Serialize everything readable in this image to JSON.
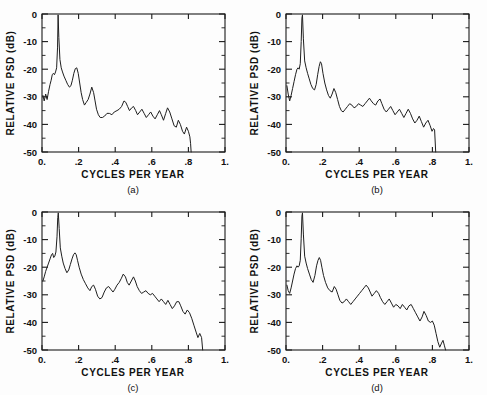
{
  "figure": {
    "panels": [
      {
        "id": "a",
        "label": "(a)",
        "xlabel": "CYCLES  PER  YEAR",
        "ylabel": "RELATIVE  PSD   (dB)",
        "xticklabels": [
          "0.",
          ".2",
          ".4",
          ".6",
          ".8",
          "1."
        ],
        "yticklabels": [
          "0",
          "-10",
          "-20",
          "-30",
          "-40",
          "-50"
        ]
      },
      {
        "id": "b",
        "label": "(b)",
        "xlabel": "CYCLES  PER  YEAR",
        "ylabel": "RELATIVE  PSD   (dB)",
        "xticklabels": [
          "0.",
          ".2",
          ".4",
          ".6",
          ".8",
          "1."
        ],
        "yticklabels": [
          "0",
          "-10",
          "-20",
          "-30",
          "-40",
          "-50"
        ]
      },
      {
        "id": "c",
        "label": "(c)",
        "xlabel": "CYCLES  PER  YEAR",
        "ylabel": "RELATIVE  PSD   (dB)",
        "xticklabels": [
          "0.",
          ".2",
          ".4",
          ".6",
          ".8",
          "1."
        ],
        "yticklabels": [
          "0",
          "-10",
          "-20",
          "-30",
          "-40",
          "-50"
        ]
      },
      {
        "id": "d",
        "label": "(d)",
        "xlabel": "CYCLES  PER  YEAR",
        "ylabel": "RELATIVE  PSD   (dB)",
        "xticklabels": [
          "0.",
          ".2",
          ".4",
          ".6",
          ".8",
          "1."
        ],
        "yticklabels": [
          "0",
          "-10",
          "-20",
          "-30",
          "-40",
          "-50"
        ]
      }
    ]
  },
  "chart_data": [
    {
      "type": "line",
      "title": "(a)",
      "xlabel": "CYCLES PER YEAR",
      "ylabel": "RELATIVE PSD (dB)",
      "xlim": [
        0.0,
        1.0
      ],
      "ylim": [
        -50,
        0
      ],
      "xticks": [
        0.0,
        0.2,
        0.4,
        0.6,
        0.8,
        1.0
      ],
      "yticks": [
        0,
        -10,
        -20,
        -30,
        -40,
        -50
      ],
      "grid": false,
      "legend": null,
      "x": [
        0.005,
        0.012,
        0.02,
        0.028,
        0.036,
        0.044,
        0.05,
        0.056,
        0.062,
        0.068,
        0.074,
        0.08,
        0.085,
        0.088,
        0.092,
        0.098,
        0.105,
        0.112,
        0.12,
        0.13,
        0.14,
        0.15,
        0.158,
        0.166,
        0.174,
        0.182,
        0.19,
        0.198,
        0.206,
        0.214,
        0.222,
        0.232,
        0.242,
        0.252,
        0.262,
        0.272,
        0.282,
        0.29,
        0.298,
        0.308,
        0.318,
        0.33,
        0.342,
        0.355,
        0.368,
        0.382,
        0.395,
        0.41,
        0.422,
        0.435,
        0.448,
        0.458,
        0.468,
        0.478,
        0.49,
        0.5,
        0.512,
        0.522,
        0.534,
        0.546,
        0.558,
        0.57,
        0.582,
        0.594,
        0.606,
        0.618,
        0.63,
        0.642,
        0.652,
        0.664,
        0.676,
        0.686,
        0.698,
        0.71,
        0.722,
        0.734,
        0.745,
        0.756,
        0.768,
        0.778,
        0.79,
        0.8,
        0.808,
        0.812,
        0.815
      ],
      "y": [
        -29.5,
        -31.5,
        -29.0,
        -31.0,
        -28.0,
        -25.5,
        -24.0,
        -22.0,
        -21.5,
        -22.0,
        -21.0,
        -19.5,
        -12.0,
        -0.3,
        -8.5,
        -16.5,
        -19.5,
        -21.0,
        -22.5,
        -24.0,
        -25.5,
        -26.5,
        -26.0,
        -24.0,
        -21.5,
        -19.8,
        -19.5,
        -21.5,
        -25.0,
        -28.5,
        -31.0,
        -33.0,
        -32.0,
        -31.0,
        -29.0,
        -26.5,
        -28.5,
        -31.5,
        -34.5,
        -36.5,
        -37.5,
        -37.5,
        -37.0,
        -36.0,
        -36.0,
        -36.5,
        -35.5,
        -35.0,
        -34.5,
        -33.5,
        -31.5,
        -32.0,
        -33.5,
        -35.0,
        -34.0,
        -33.5,
        -35.0,
        -36.5,
        -35.5,
        -34.5,
        -36.0,
        -37.5,
        -36.5,
        -35.5,
        -37.0,
        -38.0,
        -36.5,
        -35.0,
        -36.5,
        -38.5,
        -36.0,
        -34.0,
        -35.5,
        -38.0,
        -40.5,
        -41.0,
        -38.5,
        -40.0,
        -42.5,
        -43.5,
        -41.0,
        -42.5,
        -44.5,
        -47.0,
        -50.0
      ]
    },
    {
      "type": "line",
      "title": "(b)",
      "xlabel": "CYCLES PER YEAR",
      "ylabel": "RELATIVE PSD (dB)",
      "xlim": [
        0.0,
        1.0
      ],
      "ylim": [
        -50,
        0
      ],
      "xticks": [
        0.0,
        0.2,
        0.4,
        0.6,
        0.8,
        1.0
      ],
      "yticks": [
        0,
        -10,
        -20,
        -30,
        -40,
        -50
      ],
      "grid": false,
      "legend": null,
      "x": [
        0.005,
        0.012,
        0.02,
        0.028,
        0.036,
        0.044,
        0.052,
        0.06,
        0.066,
        0.072,
        0.078,
        0.083,
        0.087,
        0.09,
        0.095,
        0.102,
        0.11,
        0.118,
        0.127,
        0.136,
        0.146,
        0.156,
        0.165,
        0.173,
        0.181,
        0.188,
        0.194,
        0.202,
        0.212,
        0.222,
        0.232,
        0.242,
        0.252,
        0.262,
        0.272,
        0.282,
        0.292,
        0.302,
        0.312,
        0.324,
        0.336,
        0.348,
        0.36,
        0.372,
        0.384,
        0.396,
        0.408,
        0.42,
        0.432,
        0.444,
        0.456,
        0.466,
        0.478,
        0.49,
        0.502,
        0.514,
        0.524,
        0.536,
        0.548,
        0.56,
        0.572,
        0.584,
        0.596,
        0.608,
        0.62,
        0.632,
        0.644,
        0.656,
        0.668,
        0.68,
        0.692,
        0.704,
        0.716,
        0.728,
        0.74,
        0.752,
        0.764,
        0.776,
        0.788,
        0.798,
        0.806,
        0.812,
        0.818
      ],
      "y": [
        -26.0,
        -29.0,
        -31.5,
        -29.5,
        -27.0,
        -24.5,
        -22.0,
        -20.0,
        -19.5,
        -20.0,
        -18.0,
        -10.0,
        -1.5,
        -0.3,
        -9.0,
        -17.0,
        -19.5,
        -21.5,
        -23.5,
        -25.5,
        -27.0,
        -27.5,
        -25.5,
        -22.0,
        -19.0,
        -17.3,
        -18.0,
        -21.5,
        -25.0,
        -27.5,
        -29.5,
        -30.5,
        -29.0,
        -27.0,
        -28.5,
        -31.0,
        -33.5,
        -35.0,
        -35.5,
        -34.5,
        -33.5,
        -32.5,
        -33.0,
        -34.0,
        -33.5,
        -32.5,
        -33.0,
        -33.5,
        -32.5,
        -31.5,
        -30.5,
        -31.5,
        -32.5,
        -33.0,
        -31.5,
        -30.8,
        -32.5,
        -34.5,
        -35.5,
        -34.5,
        -33.5,
        -35.0,
        -36.5,
        -35.5,
        -34.5,
        -36.0,
        -37.5,
        -36.0,
        -34.5,
        -36.0,
        -38.0,
        -39.5,
        -38.5,
        -37.0,
        -39.0,
        -41.0,
        -39.5,
        -38.5,
        -40.5,
        -42.5,
        -41.5,
        -42.0,
        -50.0
      ]
    },
    {
      "type": "line",
      "title": "(c)",
      "xlabel": "CYCLES PER YEAR",
      "ylabel": "RELATIVE PSD (dB)",
      "xlim": [
        0.0,
        1.0
      ],
      "ylim": [
        -50,
        0
      ],
      "xticks": [
        0.0,
        0.2,
        0.4,
        0.6,
        0.8,
        1.0
      ],
      "yticks": [
        0,
        -10,
        -20,
        -30,
        -40,
        -50
      ],
      "grid": false,
      "legend": null,
      "x": [
        0.005,
        0.012,
        0.02,
        0.028,
        0.036,
        0.044,
        0.052,
        0.058,
        0.064,
        0.07,
        0.076,
        0.082,
        0.086,
        0.089,
        0.094,
        0.1,
        0.108,
        0.116,
        0.126,
        0.136,
        0.146,
        0.155,
        0.164,
        0.172,
        0.18,
        0.187,
        0.194,
        0.203,
        0.214,
        0.226,
        0.238,
        0.25,
        0.262,
        0.272,
        0.282,
        0.292,
        0.304,
        0.316,
        0.328,
        0.34,
        0.352,
        0.364,
        0.376,
        0.388,
        0.398,
        0.41,
        0.422,
        0.434,
        0.444,
        0.456,
        0.466,
        0.476,
        0.488,
        0.5,
        0.51,
        0.52,
        0.532,
        0.544,
        0.556,
        0.568,
        0.58,
        0.592,
        0.604,
        0.616,
        0.628,
        0.64,
        0.652,
        0.664,
        0.676,
        0.688,
        0.7,
        0.712,
        0.724,
        0.736,
        0.748,
        0.758,
        0.77,
        0.782,
        0.794,
        0.806,
        0.818,
        0.83,
        0.842,
        0.852,
        0.862,
        0.872,
        0.878
      ],
      "y": [
        -25.0,
        -23.5,
        -21.5,
        -20.0,
        -18.5,
        -17.0,
        -15.5,
        -15.0,
        -16.5,
        -16.0,
        -14.5,
        -9.0,
        -2.0,
        -0.3,
        -6.0,
        -13.0,
        -16.0,
        -18.5,
        -20.5,
        -22.0,
        -21.0,
        -19.0,
        -17.0,
        -15.5,
        -14.8,
        -15.5,
        -17.5,
        -20.0,
        -22.5,
        -24.5,
        -26.0,
        -27.5,
        -28.5,
        -27.0,
        -26.5,
        -28.0,
        -30.5,
        -31.5,
        -31.0,
        -29.0,
        -27.5,
        -27.0,
        -28.0,
        -29.0,
        -28.0,
        -26.5,
        -25.5,
        -24.0,
        -22.5,
        -23.5,
        -25.5,
        -26.5,
        -25.0,
        -23.5,
        -25.0,
        -27.0,
        -28.5,
        -29.5,
        -29.0,
        -28.5,
        -29.5,
        -30.0,
        -29.5,
        -30.5,
        -31.5,
        -32.5,
        -31.5,
        -32.5,
        -33.5,
        -32.0,
        -33.5,
        -35.0,
        -34.0,
        -32.5,
        -32.5,
        -34.0,
        -36.0,
        -37.0,
        -35.5,
        -36.5,
        -38.5,
        -41.0,
        -43.5,
        -45.5,
        -44.0,
        -45.5,
        -50.0
      ]
    },
    {
      "type": "line",
      "title": "(d)",
      "xlabel": "CYCLES PER YEAR",
      "ylabel": "RELATIVE PSD (dB)",
      "xlim": [
        0.0,
        1.0
      ],
      "ylim": [
        -50,
        0
      ],
      "xticks": [
        0.0,
        0.2,
        0.4,
        0.6,
        0.8,
        1.0
      ],
      "yticks": [
        0,
        -10,
        -20,
        -30,
        -40,
        -50
      ],
      "grid": false,
      "legend": null,
      "x": [
        0.005,
        0.012,
        0.02,
        0.028,
        0.036,
        0.044,
        0.052,
        0.06,
        0.066,
        0.072,
        0.078,
        0.083,
        0.087,
        0.09,
        0.095,
        0.102,
        0.11,
        0.118,
        0.128,
        0.138,
        0.148,
        0.158,
        0.167,
        0.175,
        0.182,
        0.189,
        0.196,
        0.205,
        0.216,
        0.228,
        0.24,
        0.252,
        0.264,
        0.274,
        0.284,
        0.294,
        0.306,
        0.318,
        0.33,
        0.342,
        0.354,
        0.366,
        0.378,
        0.39,
        0.402,
        0.414,
        0.426,
        0.438,
        0.45,
        0.46,
        0.47,
        0.482,
        0.494,
        0.506,
        0.516,
        0.528,
        0.54,
        0.552,
        0.564,
        0.576,
        0.588,
        0.6,
        0.612,
        0.624,
        0.636,
        0.648,
        0.66,
        0.672,
        0.684,
        0.696,
        0.708,
        0.72,
        0.732,
        0.744,
        0.754,
        0.766,
        0.778,
        0.79,
        0.8,
        0.81,
        0.82,
        0.83,
        0.84,
        0.85,
        0.858,
        0.866,
        0.872
      ],
      "y": [
        -26.5,
        -28.5,
        -29.5,
        -27.5,
        -25.0,
        -22.5,
        -20.5,
        -19.5,
        -20.0,
        -19.5,
        -17.5,
        -9.5,
        -1.5,
        -0.3,
        -8.0,
        -16.0,
        -18.5,
        -20.5,
        -22.5,
        -24.5,
        -25.5,
        -23.0,
        -19.5,
        -17.5,
        -16.5,
        -17.5,
        -20.0,
        -23.0,
        -25.5,
        -27.5,
        -28.5,
        -29.0,
        -27.0,
        -28.0,
        -30.0,
        -32.0,
        -33.0,
        -32.5,
        -31.5,
        -32.5,
        -33.5,
        -32.5,
        -31.5,
        -30.5,
        -29.5,
        -28.5,
        -27.5,
        -26.5,
        -27.5,
        -29.0,
        -30.5,
        -29.5,
        -28.5,
        -29.5,
        -31.0,
        -32.5,
        -33.5,
        -32.5,
        -31.5,
        -33.0,
        -34.5,
        -33.5,
        -34.0,
        -35.0,
        -33.5,
        -34.5,
        -35.5,
        -34.0,
        -33.5,
        -35.0,
        -36.5,
        -38.0,
        -39.5,
        -38.0,
        -36.0,
        -37.5,
        -39.5,
        -40.0,
        -39.5,
        -41.0,
        -44.0,
        -47.0,
        -49.0,
        -47.5,
        -46.5,
        -48.5,
        -50.0
      ]
    }
  ]
}
